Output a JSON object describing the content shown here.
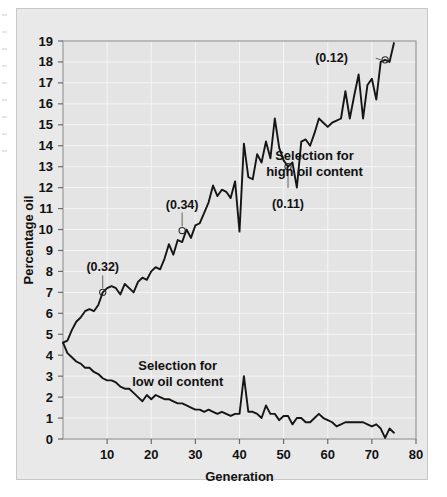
{
  "figure": {
    "background_color": "#ffffff",
    "panel_color": "#e9e9e9",
    "plot_bg_color": "#e4e4e4",
    "grid_color": "#f4f4f4",
    "axis_color": "#8a8a8a",
    "line_color": "#151515"
  },
  "chart_data": {
    "type": "line",
    "title": "",
    "xlabel": "Generation",
    "ylabel": "Percentage oil",
    "xlim": [
      0,
      80
    ],
    "ylim": [
      0,
      19
    ],
    "xticks": [
      10,
      20,
      30,
      40,
      50,
      60,
      70,
      80
    ],
    "yticks": [
      0,
      1,
      2,
      3,
      4,
      5,
      6,
      7,
      8,
      9,
      10,
      11,
      12,
      13,
      14,
      15,
      16,
      17,
      18,
      19
    ],
    "grid": true,
    "legend_position": "inline-annotations",
    "series": [
      {
        "name": "Selection for high oil content",
        "label_x": 57,
        "label_y": 13.3,
        "x": [
          0,
          1,
          2,
          3,
          4,
          5,
          6,
          7,
          8,
          9,
          10,
          11,
          12,
          13,
          14,
          15,
          16,
          17,
          18,
          19,
          20,
          21,
          22,
          23,
          24,
          25,
          26,
          27,
          28,
          29,
          30,
          31,
          32,
          33,
          34,
          35,
          36,
          37,
          38,
          39,
          40,
          41,
          42,
          43,
          44,
          45,
          46,
          47,
          48,
          49,
          50,
          51,
          52,
          53,
          54,
          55,
          56,
          57,
          58,
          59,
          60,
          61,
          62,
          63,
          64,
          65,
          66,
          67,
          68,
          69,
          70,
          71,
          72,
          73,
          74,
          75
        ],
        "y": [
          4.6,
          4.7,
          5.2,
          5.6,
          5.8,
          6.1,
          6.2,
          6.1,
          6.4,
          7.0,
          7.2,
          7.3,
          7.2,
          6.9,
          7.4,
          7.2,
          7.0,
          7.5,
          7.7,
          7.6,
          8.0,
          8.2,
          8.1,
          8.6,
          9.3,
          8.8,
          9.5,
          9.4,
          10.0,
          9.6,
          10.2,
          10.3,
          10.8,
          11.3,
          12.1,
          11.6,
          11.9,
          11.8,
          11.5,
          12.3,
          9.9,
          14.1,
          12.5,
          12.4,
          13.6,
          13.2,
          14.2,
          13.4,
          15.3,
          13.9,
          13.3,
          13.0,
          13.2,
          12.0,
          14.2,
          14.3,
          14.0,
          14.6,
          15.3,
          15.1,
          14.9,
          15.1,
          15.2,
          15.3,
          16.6,
          15.3,
          16.4,
          17.4,
          15.3,
          16.9,
          17.2,
          16.2,
          18.0,
          18.1,
          18.0,
          18.9
        ],
        "annotations": [
          {
            "text": "(0.32)",
            "point_x": 9,
            "point_y": 7.0,
            "label_x": 9,
            "label_y": 8.0
          },
          {
            "text": "(0.34)",
            "point_x": 27,
            "point_y": 9.95,
            "label_x": 27,
            "label_y": 11.0
          },
          {
            "text": "(0.11)",
            "point_x": 51,
            "point_y": 13.0,
            "label_x": 51,
            "label_y": 11.5
          },
          {
            "text": "(0.12)",
            "point_x": 73,
            "point_y": 18.1,
            "label_x": 65,
            "label_y": 18.2
          }
        ]
      },
      {
        "name": "Selection for low oil content",
        "label_x": 26,
        "label_y": 3.3,
        "x": [
          0,
          1,
          2,
          3,
          4,
          5,
          6,
          7,
          8,
          9,
          10,
          11,
          12,
          13,
          14,
          15,
          16,
          17,
          18,
          19,
          20,
          21,
          22,
          23,
          24,
          25,
          26,
          27,
          28,
          29,
          30,
          31,
          32,
          33,
          34,
          35,
          36,
          37,
          38,
          39,
          40,
          41,
          42,
          43,
          44,
          45,
          46,
          47,
          48,
          49,
          50,
          51,
          52,
          53,
          54,
          55,
          56,
          57,
          58,
          59,
          60,
          61,
          62,
          63,
          64,
          65,
          66,
          67,
          68,
          69,
          70,
          71,
          72,
          73,
          74,
          75
        ],
        "y": [
          4.6,
          4.1,
          3.9,
          3.7,
          3.6,
          3.4,
          3.4,
          3.2,
          3.1,
          2.9,
          2.8,
          2.8,
          2.7,
          2.5,
          2.4,
          2.4,
          2.2,
          2.0,
          1.8,
          2.1,
          1.9,
          2.1,
          2.0,
          1.9,
          1.9,
          1.8,
          1.7,
          1.7,
          1.6,
          1.5,
          1.4,
          1.4,
          1.3,
          1.4,
          1.3,
          1.2,
          1.3,
          1.2,
          1.1,
          1.2,
          1.2,
          3.0,
          1.3,
          1.3,
          1.2,
          1.0,
          1.6,
          1.2,
          1.2,
          0.9,
          1.1,
          1.1,
          0.7,
          1.0,
          1.0,
          0.8,
          0.8,
          1.0,
          1.2,
          1.0,
          0.9,
          0.8,
          0.6,
          0.7,
          0.8,
          0.8,
          0.8,
          0.8,
          0.8,
          0.7,
          0.6,
          0.7,
          0.5,
          0.05,
          0.5,
          0.3
        ]
      }
    ]
  }
}
